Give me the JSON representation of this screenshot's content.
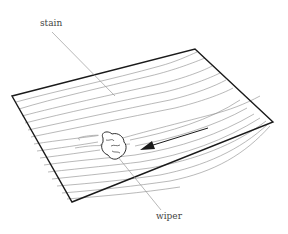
{
  "diagram": {
    "title": "",
    "labels": {
      "stain": "stain",
      "wiper": "wiper"
    },
    "elements": [
      {
        "id": "board",
        "type": "wood-panel",
        "description": "Board with wood grain in perspective"
      },
      {
        "id": "wiper",
        "type": "cloth-pad",
        "description": "Wiper cloth on board surface"
      },
      {
        "id": "arrow",
        "type": "direction-arrow",
        "description": "Arrow indicating wiping direction along grain"
      }
    ],
    "colors": {
      "outline": "#1a1a1a",
      "grain": "#8a8a8a",
      "leader": "#9a9a9a",
      "text": "#444444",
      "background": "#ffffff"
    }
  }
}
